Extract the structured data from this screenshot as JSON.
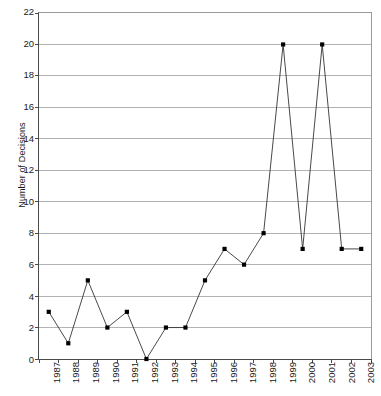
{
  "chart_data": {
    "type": "line",
    "title": "",
    "xlabel": "",
    "ylabel": "Number of Decisions",
    "categories": [
      "1987",
      "1988",
      "1989",
      "1990",
      "1991",
      "1992",
      "1993",
      "1994",
      "1995",
      "1996",
      "1997",
      "1998",
      "1999",
      "2000",
      "2001",
      "2002",
      "2003"
    ],
    "values": [
      3,
      1,
      5,
      2,
      3,
      0,
      2,
      2,
      5,
      7,
      6,
      8,
      20,
      7,
      20,
      7,
      7
    ],
    "series": [
      {
        "name": "Number of Decisions",
        "values": [
          3,
          1,
          5,
          2,
          3,
          0,
          2,
          2,
          5,
          7,
          6,
          8,
          20,
          7,
          20,
          7,
          7
        ]
      }
    ],
    "ylim": [
      0,
      22
    ],
    "ytick_step": 2,
    "yticks": [
      0,
      2,
      4,
      6,
      8,
      10,
      12,
      14,
      16,
      18,
      20,
      22
    ],
    "ytick_labels": [
      "0",
      "2",
      "4",
      "6",
      "8",
      "10",
      "12",
      "14",
      "16",
      "18",
      "20",
      "22"
    ],
    "grid": "horizontal",
    "legend": "none",
    "marker": "square",
    "line_color": "#333333",
    "marker_color": "#000000",
    "grid_color": "#b3b3b3",
    "axis_color": "#4a4a4a",
    "background": "#ffffff",
    "xtick_rotation": -90
  }
}
